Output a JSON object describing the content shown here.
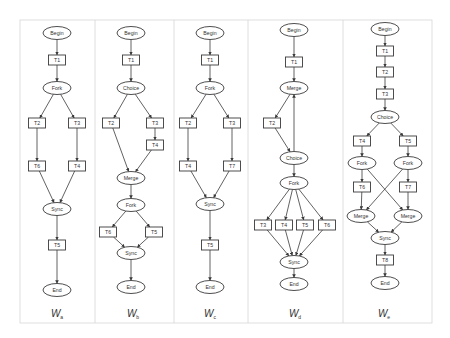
{
  "figure": {
    "panel_bounds": {
      "top": 20,
      "bottom": 323,
      "dividers": [
        20,
        95,
        174,
        248,
        343,
        432
      ]
    },
    "colors": {
      "stroke": "#3a3a3a",
      "border": "#d6d6d6",
      "text": "#333333",
      "fill": "#ffffff"
    }
  },
  "panels": [
    {
      "caption": "W",
      "caption_sub": "a",
      "caption_x": 57,
      "nodes": [
        {
          "id": "begin",
          "label": "Begin",
          "shape": "ellipse",
          "x": 57,
          "y": 33
        },
        {
          "id": "t1",
          "label": "T1",
          "shape": "rect",
          "x": 57,
          "y": 60
        },
        {
          "id": "fork",
          "label": "Fork",
          "shape": "ellipse",
          "x": 57,
          "y": 88
        },
        {
          "id": "t2",
          "label": "T2",
          "shape": "rect",
          "x": 37,
          "y": 123
        },
        {
          "id": "t3",
          "label": "T3",
          "shape": "rect",
          "x": 77,
          "y": 123
        },
        {
          "id": "t6",
          "label": "T6",
          "shape": "rect",
          "x": 37,
          "y": 166
        },
        {
          "id": "t4",
          "label": "T4",
          "shape": "rect",
          "x": 77,
          "y": 166
        },
        {
          "id": "sync",
          "label": "Sync",
          "shape": "ellipse",
          "x": 57,
          "y": 209
        },
        {
          "id": "t5",
          "label": "T5",
          "shape": "rect",
          "x": 57,
          "y": 245
        },
        {
          "id": "end",
          "label": "End",
          "shape": "ellipse",
          "x": 57,
          "y": 290
        }
      ],
      "edges": [
        [
          "begin",
          "t1"
        ],
        [
          "t1",
          "fork"
        ],
        [
          "fork",
          "t2"
        ],
        [
          "fork",
          "t3"
        ],
        [
          "t2",
          "t6"
        ],
        [
          "t3",
          "t4"
        ],
        [
          "t6",
          "sync"
        ],
        [
          "t4",
          "sync"
        ],
        [
          "sync",
          "t5"
        ],
        [
          "t5",
          "end"
        ]
      ]
    },
    {
      "caption": "W",
      "caption_sub": "b",
      "caption_x": 133,
      "nodes": [
        {
          "id": "begin",
          "label": "Begin",
          "shape": "ellipse",
          "x": 131,
          "y": 33
        },
        {
          "id": "t1",
          "label": "T1",
          "shape": "rect",
          "x": 131,
          "y": 60
        },
        {
          "id": "choice",
          "label": "Choice",
          "shape": "ellipse",
          "x": 131,
          "y": 88
        },
        {
          "id": "t2",
          "label": "T2",
          "shape": "rect",
          "x": 111,
          "y": 123
        },
        {
          "id": "t3",
          "label": "T3",
          "shape": "rect",
          "x": 155,
          "y": 123
        },
        {
          "id": "t4",
          "label": "T4",
          "shape": "rect",
          "x": 155,
          "y": 145
        },
        {
          "id": "merge",
          "label": "Merge",
          "shape": "ellipse",
          "x": 131,
          "y": 178
        },
        {
          "id": "fork",
          "label": "Fork",
          "shape": "ellipse",
          "x": 131,
          "y": 205
        },
        {
          "id": "t6",
          "label": "T6",
          "shape": "rect",
          "x": 108,
          "y": 232
        },
        {
          "id": "t5",
          "label": "T5",
          "shape": "rect",
          "x": 154,
          "y": 232
        },
        {
          "id": "sync",
          "label": "Sync",
          "shape": "ellipse",
          "x": 131,
          "y": 253
        },
        {
          "id": "end",
          "label": "End",
          "shape": "ellipse",
          "x": 131,
          "y": 287
        }
      ],
      "edges": [
        [
          "begin",
          "t1"
        ],
        [
          "t1",
          "choice"
        ],
        [
          "choice",
          "t2"
        ],
        [
          "choice",
          "t3"
        ],
        [
          "t3",
          "t4"
        ],
        [
          "t2",
          "merge"
        ],
        [
          "t4",
          "merge"
        ],
        [
          "merge",
          "fork"
        ],
        [
          "fork",
          "t6"
        ],
        [
          "fork",
          "t5"
        ],
        [
          "t6",
          "sync"
        ],
        [
          "t5",
          "sync"
        ],
        [
          "sync",
          "end"
        ]
      ]
    },
    {
      "caption": "W",
      "caption_sub": "c",
      "caption_x": 210,
      "nodes": [
        {
          "id": "begin",
          "label": "Begin",
          "shape": "ellipse",
          "x": 210,
          "y": 33
        },
        {
          "id": "t1",
          "label": "T1",
          "shape": "rect",
          "x": 210,
          "y": 60
        },
        {
          "id": "fork",
          "label": "Fork",
          "shape": "ellipse",
          "x": 210,
          "y": 88
        },
        {
          "id": "t2",
          "label": "T2",
          "shape": "rect",
          "x": 188,
          "y": 123
        },
        {
          "id": "t3",
          "label": "T3",
          "shape": "rect",
          "x": 232,
          "y": 123
        },
        {
          "id": "t4",
          "label": "T4",
          "shape": "rect",
          "x": 188,
          "y": 166
        },
        {
          "id": "t7",
          "label": "T7",
          "shape": "rect",
          "x": 232,
          "y": 166
        },
        {
          "id": "sync",
          "label": "Sync",
          "shape": "ellipse",
          "x": 210,
          "y": 204
        },
        {
          "id": "t5",
          "label": "T5",
          "shape": "rect",
          "x": 210,
          "y": 245
        },
        {
          "id": "end",
          "label": "End",
          "shape": "ellipse",
          "x": 210,
          "y": 287
        }
      ],
      "edges": [
        [
          "begin",
          "t1"
        ],
        [
          "t1",
          "fork"
        ],
        [
          "fork",
          "t2"
        ],
        [
          "fork",
          "t3"
        ],
        [
          "t2",
          "t4"
        ],
        [
          "t3",
          "t7"
        ],
        [
          "t4",
          "sync"
        ],
        [
          "t7",
          "sync"
        ],
        [
          "sync",
          "t5"
        ],
        [
          "t5",
          "end"
        ]
      ]
    },
    {
      "caption": "W",
      "caption_sub": "d",
      "caption_x": 295,
      "nodes": [
        {
          "id": "begin",
          "label": "Begin",
          "shape": "ellipse",
          "x": 294,
          "y": 30
        },
        {
          "id": "t1",
          "label": "T1",
          "shape": "rect",
          "x": 294,
          "y": 62
        },
        {
          "id": "merge",
          "label": "Merge",
          "shape": "ellipse",
          "x": 294,
          "y": 88
        },
        {
          "id": "t2",
          "label": "T2",
          "shape": "rect",
          "x": 272,
          "y": 123
        },
        {
          "id": "choice",
          "label": "Choice",
          "shape": "ellipse",
          "x": 294,
          "y": 158
        },
        {
          "id": "fork",
          "label": "Fork",
          "shape": "ellipse",
          "x": 294,
          "y": 183
        },
        {
          "id": "t3",
          "label": "T3",
          "shape": "rect",
          "x": 263,
          "y": 225
        },
        {
          "id": "t4",
          "label": "T4",
          "shape": "rect",
          "x": 284,
          "y": 225
        },
        {
          "id": "t5",
          "label": "T5",
          "shape": "rect",
          "x": 305,
          "y": 225
        },
        {
          "id": "t6",
          "label": "T6",
          "shape": "rect",
          "x": 327,
          "y": 225
        },
        {
          "id": "sync",
          "label": "Sync",
          "shape": "ellipse",
          "x": 294,
          "y": 262
        },
        {
          "id": "end",
          "label": "End",
          "shape": "ellipse",
          "x": 294,
          "y": 284
        }
      ],
      "edges": [
        [
          "begin",
          "t1"
        ],
        [
          "t1",
          "merge"
        ],
        [
          "merge",
          "t2"
        ],
        [
          "t2",
          "choice"
        ],
        [
          "choice",
          "merge"
        ],
        [
          "choice",
          "fork"
        ],
        [
          "fork",
          "t3"
        ],
        [
          "fork",
          "t4"
        ],
        [
          "fork",
          "t5"
        ],
        [
          "fork",
          "t6"
        ],
        [
          "t3",
          "sync"
        ],
        [
          "t4",
          "sync"
        ],
        [
          "t5",
          "sync"
        ],
        [
          "t6",
          "sync"
        ],
        [
          "sync",
          "end"
        ]
      ]
    },
    {
      "caption": "W",
      "caption_sub": "e",
      "caption_x": 384,
      "nodes": [
        {
          "id": "begin",
          "label": "Begin",
          "shape": "ellipse",
          "x": 385,
          "y": 29
        },
        {
          "id": "t1",
          "label": "T1",
          "shape": "rect",
          "x": 385,
          "y": 51
        },
        {
          "id": "t2",
          "label": "T2",
          "shape": "rect",
          "x": 385,
          "y": 72
        },
        {
          "id": "t3",
          "label": "T3",
          "shape": "rect",
          "x": 385,
          "y": 94
        },
        {
          "id": "choice",
          "label": "Choice",
          "shape": "ellipse",
          "x": 385,
          "y": 117
        },
        {
          "id": "t4",
          "label": "T4",
          "shape": "rect",
          "x": 362,
          "y": 141
        },
        {
          "id": "t5",
          "label": "T5",
          "shape": "rect",
          "x": 408,
          "y": 141
        },
        {
          "id": "forkL",
          "label": "Fork",
          "shape": "ellipse",
          "x": 362,
          "y": 163
        },
        {
          "id": "forkR",
          "label": "Fork",
          "shape": "ellipse",
          "x": 408,
          "y": 163
        },
        {
          "id": "t6",
          "label": "T6",
          "shape": "rect",
          "x": 362,
          "y": 187
        },
        {
          "id": "t7",
          "label": "T7",
          "shape": "rect",
          "x": 408,
          "y": 187
        },
        {
          "id": "mergeL",
          "label": "Merge",
          "shape": "ellipse",
          "x": 361,
          "y": 216
        },
        {
          "id": "mergeR",
          "label": "Merge",
          "shape": "ellipse",
          "x": 408,
          "y": 216
        },
        {
          "id": "sync",
          "label": "Sync",
          "shape": "ellipse",
          "x": 385,
          "y": 238
        },
        {
          "id": "t8",
          "label": "T8",
          "shape": "rect",
          "x": 385,
          "y": 260
        },
        {
          "id": "end",
          "label": "End",
          "shape": "ellipse",
          "x": 385,
          "y": 283
        }
      ],
      "edges": [
        [
          "begin",
          "t1"
        ],
        [
          "t1",
          "t2"
        ],
        [
          "t2",
          "t3"
        ],
        [
          "t3",
          "choice"
        ],
        [
          "choice",
          "t4"
        ],
        [
          "choice",
          "t5"
        ],
        [
          "t4",
          "forkL"
        ],
        [
          "t5",
          "forkR"
        ],
        [
          "forkL",
          "t6"
        ],
        [
          "forkR",
          "t7"
        ],
        [
          "forkL",
          "mergeR"
        ],
        [
          "forkR",
          "mergeL"
        ],
        [
          "t6",
          "mergeL"
        ],
        [
          "t7",
          "mergeR"
        ],
        [
          "mergeL",
          "sync"
        ],
        [
          "mergeR",
          "sync"
        ],
        [
          "sync",
          "t8"
        ],
        [
          "t8",
          "end"
        ]
      ]
    }
  ]
}
